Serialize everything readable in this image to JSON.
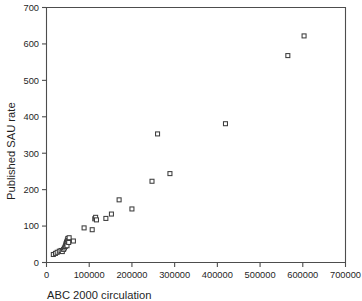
{
  "chart_data": {
    "type": "scatter",
    "title": "",
    "xlabel": "ABC 2000 circulation",
    "ylabel": "Published SAU rate",
    "xlim": [
      0,
      700000
    ],
    "ylim": [
      0,
      700
    ],
    "xticks": [
      0,
      100000,
      200000,
      300000,
      400000,
      500000,
      600000,
      700000
    ],
    "yticks": [
      0,
      100,
      200,
      300,
      400,
      500,
      600,
      700
    ],
    "xtick_labels": [
      "0",
      "100000",
      "200000",
      "300000",
      "400000",
      "500000",
      "600000",
      "700000"
    ],
    "ytick_labels": [
      "0",
      "100",
      "200",
      "300",
      "400",
      "500",
      "600",
      "700"
    ],
    "grid": false,
    "legend": null,
    "marker": "open-square",
    "marker_color": "#3d3d3d",
    "marker_fill": "#ffffff",
    "series": [
      {
        "name": "Newspapers",
        "points": [
          [
            16000,
            22
          ],
          [
            21000,
            25
          ],
          [
            25000,
            28
          ],
          [
            30000,
            31
          ],
          [
            34000,
            33
          ],
          [
            37000,
            30
          ],
          [
            40000,
            36
          ],
          [
            42000,
            40
          ],
          [
            44000,
            44
          ],
          [
            45000,
            48
          ],
          [
            46000,
            52
          ],
          [
            47000,
            55
          ],
          [
            48000,
            58
          ],
          [
            48000,
            46
          ],
          [
            49000,
            62
          ],
          [
            50000,
            66
          ],
          [
            51000,
            60
          ],
          [
            52000,
            55
          ],
          [
            53000,
            68
          ],
          [
            63000,
            59
          ],
          [
            88000,
            95
          ],
          [
            107000,
            90
          ],
          [
            113000,
            120
          ],
          [
            115000,
            124
          ],
          [
            117000,
            117
          ],
          [
            139000,
            121
          ],
          [
            152000,
            133
          ],
          [
            170000,
            172
          ],
          [
            200000,
            147
          ],
          [
            247000,
            223
          ],
          [
            260000,
            353
          ],
          [
            289000,
            244
          ],
          [
            419000,
            381
          ],
          [
            565000,
            568
          ],
          [
            603000,
            622
          ]
        ]
      }
    ]
  },
  "figure": {
    "axis_color": "#4d4d4d",
    "background": "#ffffff"
  }
}
